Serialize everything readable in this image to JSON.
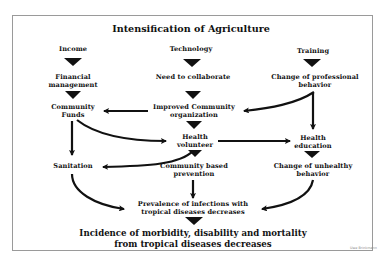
{
  "diagram": {
    "title": "Intensification of Agriculture",
    "columns": {
      "income": {
        "heading": "Income",
        "step1_line1": "Financial",
        "step1_line2": "management",
        "step2_line1": "Community",
        "step2_line2": "Funds",
        "step3": "Sanitation"
      },
      "technology": {
        "heading": "Technology",
        "step1": "Need to collaborate",
        "step2_line1": "Improved Community",
        "step2_line2": "organization",
        "step3_line1": "Health",
        "step3_line2": "volunteer",
        "step4_line1": "Community based",
        "step4_line2": "prevention"
      },
      "training": {
        "heading": "Training",
        "step1_line1": "Change of professional",
        "step1_line2": "behavior",
        "step2_line1": "Health",
        "step2_line2": "education",
        "step3_line1": "Change of unhealthy",
        "step3_line2": "behavior"
      }
    },
    "prevalence_line1": "Prevalence of infections with",
    "prevalence_line2": "tropical diseases decreases",
    "outcome_line1": "Incidence of morbidity, disability and mortality",
    "outcome_line2": "from tropical diseases decreases",
    "signature": "Uwe Brinkmann",
    "edges": [
      {
        "from": "Income",
        "to": "Financial management",
        "style": "triangle"
      },
      {
        "from": "Technology",
        "to": "Need to collaborate",
        "style": "triangle"
      },
      {
        "from": "Training",
        "to": "Change of professional behavior",
        "style": "triangle"
      },
      {
        "from": "Financial management",
        "to": "Community Funds",
        "style": "triangle"
      },
      {
        "from": "Need to collaborate",
        "to": "Improved Community organization",
        "style": "triangle"
      },
      {
        "from": "Improved Community organization",
        "to": "Community Funds",
        "style": "arrow"
      },
      {
        "from": "Change of professional behavior",
        "to": "Improved Community organization",
        "style": "curved-arrow"
      },
      {
        "from": "Change of professional behavior",
        "to": "Health education",
        "style": "arrow"
      },
      {
        "from": "Improved Community organization",
        "to": "Health volunteer",
        "style": "triangle"
      },
      {
        "from": "Community Funds",
        "to": "Health volunteer",
        "style": "curved-arrow"
      },
      {
        "from": "Community Funds",
        "to": "Sanitation",
        "style": "arrow"
      },
      {
        "from": "Health volunteer",
        "to": "Health education",
        "style": "arrow"
      },
      {
        "from": "Health volunteer",
        "to": "Sanitation",
        "style": "curved-arrow"
      },
      {
        "from": "Health volunteer",
        "to": "Community based prevention",
        "style": "triangle"
      },
      {
        "from": "Health education",
        "to": "Change of unhealthy behavior",
        "style": "triangle"
      },
      {
        "from": "Sanitation",
        "to": "Prevalence of infections with tropical diseases decreases",
        "style": "curved-arrow"
      },
      {
        "from": "Community based prevention",
        "to": "Prevalence of infections with tropical diseases decreases",
        "style": "arrow"
      },
      {
        "from": "Change of unhealthy behavior",
        "to": "Prevalence of infections with tropical diseases decreases",
        "style": "curved-arrow"
      },
      {
        "from": "Prevalence of infections with tropical diseases decreases",
        "to": "Incidence of morbidity, disability and mortality from tropical diseases decreases",
        "style": "triangle"
      }
    ],
    "colors": {
      "ink": "#111111",
      "frame": "#9a9a9a",
      "background": "#ffffff"
    }
  }
}
